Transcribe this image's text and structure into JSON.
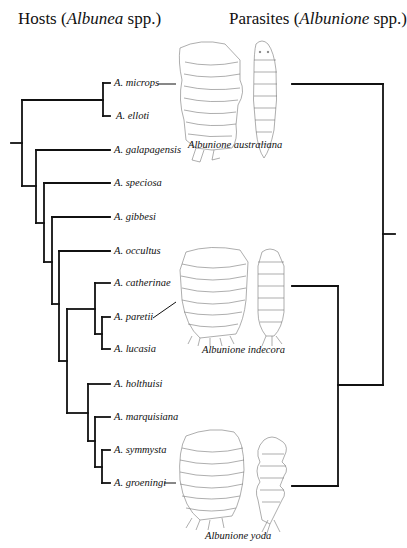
{
  "headings": {
    "hosts": {
      "prefix": "Hosts (",
      "genus": "Albunea",
      "suffix": " spp.)"
    },
    "parasites": {
      "prefix": "Parasites (",
      "genus": "Albunione",
      "suffix": " spp.)"
    }
  },
  "hosts": [
    {
      "name": "A. microps",
      "y": 83
    },
    {
      "name": "A. elloti",
      "y": 116
    },
    {
      "name": "A. galapagensis",
      "y": 150
    },
    {
      "name": "A. speciosa",
      "y": 183
    },
    {
      "name": "A. gibbesi",
      "y": 217
    },
    {
      "name": "A. occultus",
      "y": 251
    },
    {
      "name": "A. catherinae",
      "y": 283
    },
    {
      "name": "A. paretii",
      "y": 317
    },
    {
      "name": "A. lucasia",
      "y": 349
    },
    {
      "name": "A. holthuisi",
      "y": 384
    },
    {
      "name": "A. marquisiana",
      "y": 417
    },
    {
      "name": "A. symmysta",
      "y": 450
    },
    {
      "name": "A. groeningi",
      "y": 483
    }
  ],
  "parasites": [
    {
      "name": "Albunione australiana",
      "associated_host": "A. microps",
      "y": 84
    },
    {
      "name": "Albunione indecora",
      "associated_host": "A. paretii",
      "y": 286
    },
    {
      "name": "Albunione yoda",
      "associated_host": "A. groeningi",
      "y": 486
    }
  ],
  "colors": {
    "line": "#111111",
    "drawing": "#666666",
    "background": "#ffffff"
  }
}
